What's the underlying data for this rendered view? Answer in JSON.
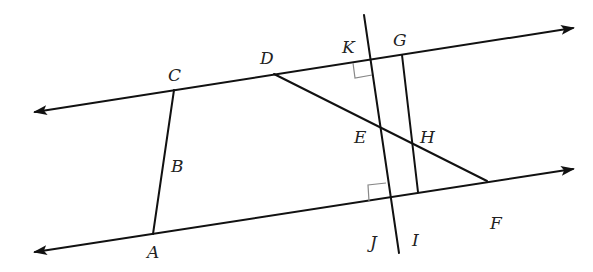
{
  "diagram": {
    "type": "geometry",
    "colors": {
      "line": "#111111",
      "right_angle_marker": "#888888",
      "label": "#222222",
      "background": "#ffffff"
    },
    "lines": [
      {
        "id": "top-line",
        "from": [
          35,
          112
        ],
        "to": [
          573,
          28
        ],
        "arrows": "both"
      },
      {
        "id": "bottom-line",
        "from": [
          35,
          252
        ],
        "to": [
          573,
          169
        ],
        "arrows": "both"
      }
    ],
    "segments": [
      {
        "id": "CA",
        "from": [
          174,
          90
        ],
        "to": [
          153,
          234
        ]
      },
      {
        "id": "KJ-transversal",
        "from": [
          364,
          15
        ],
        "to": [
          399,
          253
        ]
      },
      {
        "id": "GI",
        "from": [
          402,
          55
        ],
        "to": [
          418,
          192
        ]
      },
      {
        "id": "DF",
        "from": [
          274,
          74
        ],
        "to": [
          487,
          181
        ]
      }
    ],
    "right_angles": [
      {
        "at": "K",
        "vertex": [
          370,
          60
        ]
      },
      {
        "at": "J",
        "vertex": [
          391,
          197
        ]
      }
    ],
    "labels": [
      {
        "text": "C",
        "x": 168,
        "y": 81
      },
      {
        "text": "D",
        "x": 260,
        "y": 64
      },
      {
        "text": "K",
        "x": 342,
        "y": 53
      },
      {
        "text": "G",
        "x": 393,
        "y": 46
      },
      {
        "text": "E",
        "x": 354,
        "y": 143
      },
      {
        "text": "H",
        "x": 420,
        "y": 143
      },
      {
        "text": "B",
        "x": 171,
        "y": 172
      },
      {
        "text": "A",
        "x": 147,
        "y": 258
      },
      {
        "text": "J",
        "x": 370,
        "y": 248
      },
      {
        "text": "I",
        "x": 412,
        "y": 246
      },
      {
        "text": "F",
        "x": 490,
        "y": 229
      }
    ]
  }
}
